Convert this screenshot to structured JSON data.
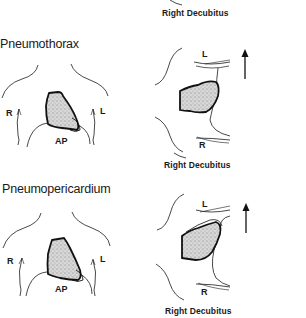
{
  "figure": {
    "top_caption": "Right Decubitus",
    "panels": [
      {
        "title": "Pneumothorax",
        "ap_view": {
          "label": "AP",
          "right_label": "R",
          "left_label": "L"
        },
        "decubitus_view": {
          "caption": "Right Decubitus",
          "top_label": "L",
          "bottom_label": "R",
          "arrow": "up-arrow"
        }
      },
      {
        "title": "Pneumopericardium",
        "ap_view": {
          "label": "AP",
          "right_label": "R",
          "left_label": "L"
        },
        "decubitus_view": {
          "caption": "Right Decubitus",
          "top_label": "L",
          "bottom_label": "R",
          "arrow": "up-arrow"
        }
      }
    ]
  },
  "colors": {
    "ink": "#1a1a1a",
    "background": "#ffffff",
    "heart_fill": "#cfcfcf"
  }
}
